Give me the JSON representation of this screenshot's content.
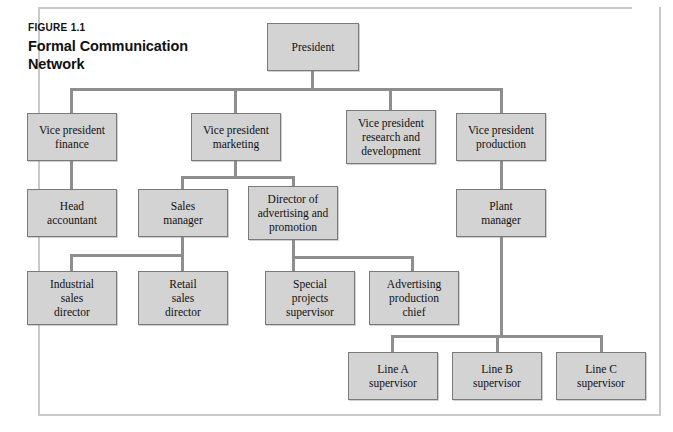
{
  "figure": {
    "label": "FIGURE 1.1"
  },
  "colors": {
    "box_fill": "#d3d3d3",
    "box_border": "#7a7a7a",
    "connector": "#8e8e8e",
    "frame": "#c9c9c9",
    "text": "#111111",
    "page_background": "#ffffff"
  },
  "chart_data": {
    "type": "diagram",
    "diagram_type": "organizational-chart",
    "figure_number": "FIGURE 1.1",
    "levels": 5,
    "nodes": [
      {
        "id": "president",
        "label": "President",
        "level": 0,
        "x": 267,
        "y": 23,
        "w": 92,
        "h": 48
      },
      {
        "id": "vp-finance",
        "label": "Vice president\nfinance",
        "level": 1,
        "x": 27,
        "y": 113,
        "w": 90,
        "h": 48
      },
      {
        "id": "vp-marketing",
        "label": "Vice president\nmarketing",
        "level": 1,
        "x": 191,
        "y": 113,
        "w": 90,
        "h": 48
      },
      {
        "id": "vp-research",
        "label": "Vice president\nresearch and\ndevelopment",
        "level": 1,
        "x": 346,
        "y": 110,
        "w": 90,
        "h": 54
      },
      {
        "id": "vp-production",
        "label": "Vice president\nproduction",
        "level": 1,
        "x": 456,
        "y": 113,
        "w": 90,
        "h": 48
      },
      {
        "id": "head-accountant",
        "label": "Head\naccountant",
        "level": 2,
        "x": 27,
        "y": 189,
        "w": 90,
        "h": 48
      },
      {
        "id": "sales-manager",
        "label": "Sales\nmanager",
        "level": 2,
        "x": 138,
        "y": 189,
        "w": 90,
        "h": 48
      },
      {
        "id": "director-advertising",
        "label": "Director of\nadvertising and\npromotion",
        "level": 2,
        "x": 248,
        "y": 186,
        "w": 90,
        "h": 54
      },
      {
        "id": "plant-manager",
        "label": "Plant\nmanager",
        "level": 2,
        "x": 456,
        "y": 189,
        "w": 90,
        "h": 48
      },
      {
        "id": "industrial-sales",
        "label": "Industrial\nsales\ndirector",
        "level": 3,
        "x": 27,
        "y": 271,
        "w": 90,
        "h": 54
      },
      {
        "id": "retail-sales",
        "label": "Retail\nsales\ndirector",
        "level": 3,
        "x": 138,
        "y": 271,
        "w": 90,
        "h": 54
      },
      {
        "id": "special-projects",
        "label": "Special\nprojects\nsupervisor",
        "level": 3,
        "x": 265,
        "y": 271,
        "w": 90,
        "h": 54
      },
      {
        "id": "advertising-production",
        "label": "Advertising\nproduction\nchief",
        "level": 3,
        "x": 369,
        "y": 271,
        "w": 90,
        "h": 54
      },
      {
        "id": "line-a",
        "label": "Line A\nsupervisor",
        "level": 4,
        "x": 348,
        "y": 352,
        "w": 90,
        "h": 48
      },
      {
        "id": "line-b",
        "label": "Line B\nsupervisor",
        "level": 4,
        "x": 452,
        "y": 352,
        "w": 90,
        "h": 48
      },
      {
        "id": "line-c",
        "label": "Line C\nsupervisor",
        "level": 4,
        "x": 556,
        "y": 352,
        "w": 90,
        "h": 48
      }
    ],
    "edges": [
      {
        "from": "president",
        "to": "vp-finance"
      },
      {
        "from": "president",
        "to": "vp-marketing"
      },
      {
        "from": "president",
        "to": "vp-research"
      },
      {
        "from": "president",
        "to": "vp-production"
      },
      {
        "from": "vp-finance",
        "to": "head-accountant"
      },
      {
        "from": "vp-marketing",
        "to": "sales-manager"
      },
      {
        "from": "vp-marketing",
        "to": "director-advertising"
      },
      {
        "from": "vp-production",
        "to": "plant-manager"
      },
      {
        "from": "sales-manager",
        "to": "industrial-sales"
      },
      {
        "from": "sales-manager",
        "to": "retail-sales"
      },
      {
        "from": "director-advertising",
        "to": "special-projects"
      },
      {
        "from": "director-advertising",
        "to": "advertising-production"
      },
      {
        "from": "plant-manager",
        "to": "line-a"
      },
      {
        "from": "plant-manager",
        "to": "line-b"
      },
      {
        "from": "plant-manager",
        "to": "line-c"
      }
    ],
    "connectors": [
      {
        "name": "president-stem",
        "orient": "v",
        "x": 311,
        "y": 71,
        "len": 17
      },
      {
        "name": "president-bus",
        "orient": "h",
        "x": 70,
        "y": 88,
        "len": 431
      },
      {
        "name": "vp-finance-drop",
        "orient": "v",
        "x": 70,
        "y": 88,
        "len": 25
      },
      {
        "name": "vp-marketing-drop",
        "orient": "v",
        "x": 234,
        "y": 88,
        "len": 25
      },
      {
        "name": "vp-research-drop",
        "orient": "v",
        "x": 389,
        "y": 88,
        "len": 22
      },
      {
        "name": "vp-production-drop",
        "orient": "v",
        "x": 500,
        "y": 88,
        "len": 25
      },
      {
        "name": "vp-finance-to-head",
        "orient": "v",
        "x": 70,
        "y": 161,
        "len": 28
      },
      {
        "name": "vp-marketing-stem",
        "orient": "v",
        "x": 234,
        "y": 161,
        "len": 15
      },
      {
        "name": "marketing-bus",
        "orient": "h",
        "x": 181,
        "y": 176,
        "len": 112
      },
      {
        "name": "sales-manager-drop",
        "orient": "v",
        "x": 181,
        "y": 176,
        "len": 13
      },
      {
        "name": "director-adv-drop",
        "orient": "v",
        "x": 292,
        "y": 176,
        "len": 10
      },
      {
        "name": "vp-production-to-plant",
        "orient": "v",
        "x": 500,
        "y": 161,
        "len": 28
      },
      {
        "name": "sales-manager-stem",
        "orient": "v",
        "x": 181,
        "y": 237,
        "len": 17
      },
      {
        "name": "sales-bus",
        "orient": "h",
        "x": 70,
        "y": 254,
        "len": 113
      },
      {
        "name": "industrial-sales-drop",
        "orient": "v",
        "x": 70,
        "y": 254,
        "len": 18
      },
      {
        "name": "retail-sales-drop",
        "orient": "v",
        "x": 181,
        "y": 254,
        "len": 18
      },
      {
        "name": "director-adv-stem",
        "orient": "v",
        "x": 292,
        "y": 240,
        "len": 16
      },
      {
        "name": "advertising-bus",
        "orient": "h",
        "x": 292,
        "y": 256,
        "len": 121
      },
      {
        "name": "special-projects-drop",
        "orient": "v",
        "x": 292,
        "y": 256,
        "len": 16
      },
      {
        "name": "advertising-prod-drop",
        "orient": "v",
        "x": 411,
        "y": 256,
        "len": 16
      },
      {
        "name": "plant-manager-stem",
        "orient": "v",
        "x": 500,
        "y": 237,
        "len": 98
      },
      {
        "name": "line-bus",
        "orient": "h",
        "x": 391,
        "y": 335,
        "len": 211
      },
      {
        "name": "line-a-drop",
        "orient": "v",
        "x": 391,
        "y": 335,
        "len": 18
      },
      {
        "name": "line-b-drop",
        "orient": "v",
        "x": 496,
        "y": 335,
        "len": 18
      },
      {
        "name": "line-c-drop",
        "orient": "v",
        "x": 600,
        "y": 335,
        "len": 18
      }
    ]
  }
}
